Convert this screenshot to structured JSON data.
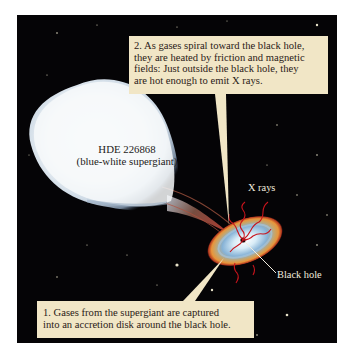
{
  "figure": {
    "type": "astronomy illustration"
  },
  "star": {
    "name": "HDE 226868",
    "description": "(blue-white supergiant)"
  },
  "labels": {
    "xrays": "X rays",
    "black_hole": "Black hole"
  },
  "callouts": [
    {
      "number": 1,
      "lines": [
        "1. Gases from the supergiant are captured",
        "into an accretion disk around the black hole."
      ]
    },
    {
      "number": 2,
      "lines": [
        "2. As gases spiral toward the black hole,",
        "they are heated by friction and magnetic",
        "fields: Just outside the black hole, they",
        "are hot enough to emit X rays."
      ]
    }
  ],
  "colors": {
    "background_space": "#050406",
    "callout_fill": "#f1e6c6",
    "callout_text": "#2a2016",
    "xray_red": "#c8141c",
    "disk_blue": "#8fb8d8",
    "disk_orange": "#e9953a"
  }
}
